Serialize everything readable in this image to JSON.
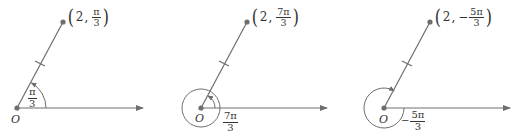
{
  "figure": {
    "colors": {
      "line": "#6e6e6e",
      "point": "#6e6e6e",
      "text": "#333333",
      "background": "#ffffff"
    }
  },
  "panels": [
    {
      "origin_label": "O",
      "point_label": {
        "r": "2",
        "sep": ",",
        "num": "π",
        "den": "3",
        "sign": ""
      },
      "angle_label": {
        "num": "π",
        "den": "3",
        "sign": ""
      },
      "angle_radians": "π/3",
      "arc_direction": "counterclockwise"
    },
    {
      "origin_label": "O",
      "point_label": {
        "r": "2",
        "sep": ",",
        "num": "7π",
        "den": "3",
        "sign": ""
      },
      "angle_label": {
        "num": "7π",
        "den": "3",
        "sign": ""
      },
      "angle_radians": "7π/3",
      "arc_direction": "counterclockwise"
    },
    {
      "origin_label": "O",
      "point_label": {
        "r": "2",
        "sep": ",",
        "num": "5π",
        "den": "3",
        "sign": "−"
      },
      "angle_label": {
        "num": "5π",
        "den": "3",
        "sign": "−"
      },
      "angle_radians": "−5π/3",
      "arc_direction": "clockwise"
    }
  ]
}
